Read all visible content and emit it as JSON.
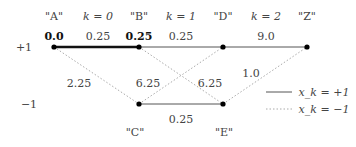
{
  "states": {
    "top": "+1",
    "bottom": "−1"
  },
  "nodes": [
    {
      "id": "A",
      "label": "\"A\"",
      "metric": "0.0",
      "row": "top"
    },
    {
      "id": "B",
      "label": "\"B\"",
      "metric": "0.25",
      "row": "top"
    },
    {
      "id": "D",
      "label": "\"D\"",
      "metric": "",
      "row": "top"
    },
    {
      "id": "Z",
      "label": "\"Z\"",
      "metric": "",
      "row": "top"
    },
    {
      "id": "C",
      "label": "\"C\"",
      "metric": "",
      "row": "bottom"
    },
    {
      "id": "E",
      "label": "\"E\"",
      "metric": "",
      "row": "bottom"
    }
  ],
  "stages": [
    {
      "label": "k = 0"
    },
    {
      "label": "k = 1"
    },
    {
      "label": "k = 2"
    }
  ],
  "edges": [
    {
      "from": "A",
      "to": "B",
      "weight": "0.25",
      "style": "solid",
      "highlight": true
    },
    {
      "from": "B",
      "to": "D",
      "weight": "0.25",
      "style": "solid"
    },
    {
      "from": "D",
      "to": "Z",
      "weight": "9.0",
      "style": "solid"
    },
    {
      "from": "C",
      "to": "E",
      "weight": "0.25",
      "style": "solid"
    },
    {
      "from": "A",
      "to": "C",
      "weight": "2.25",
      "style": "dotted"
    },
    {
      "from": "C",
      "to": "D",
      "weight": "6.25",
      "style": "dotted"
    },
    {
      "from": "B",
      "to": "E",
      "weight": "6.25",
      "style": "dotted"
    },
    {
      "from": "E",
      "to": "Z",
      "weight": "1.0",
      "style": "dotted"
    }
  ],
  "legend": {
    "solid": "x_k = +1",
    "dotted": "x_k = −1"
  }
}
